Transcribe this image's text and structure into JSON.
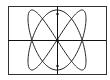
{
  "figure": {
    "type": "lissajous",
    "frame": {
      "x": 8,
      "y": 6,
      "width": 98,
      "height": 68
    },
    "center": {
      "x": 57,
      "y": 40
    },
    "x_amplitude": 29,
    "y_amplitude": 30,
    "x_frequency": 2,
    "y_frequency": 3,
    "stroke_color": "#222222",
    "axis_color": "#111111",
    "frame_color": "#333333"
  }
}
